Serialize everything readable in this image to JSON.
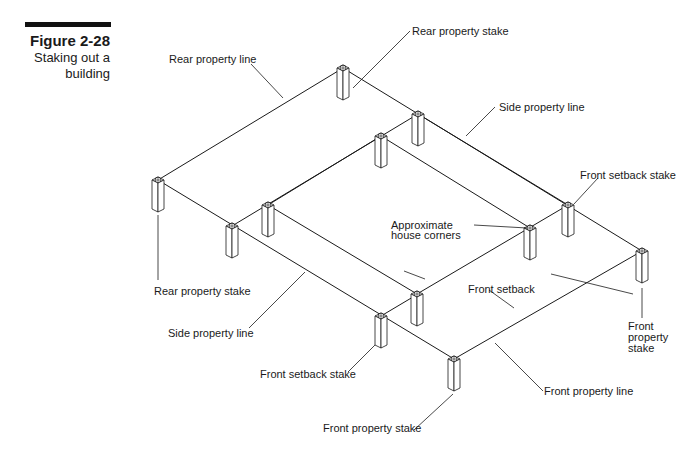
{
  "figure": {
    "number": "Figure 2-28",
    "caption_line1": "Staking out a",
    "caption_line2": "building"
  },
  "labels": {
    "rear_property_line": "Rear property line",
    "rear_property_stake_top": "Rear property stake",
    "side_property_line_top": "Side property line",
    "front_setback_stake_right": "Front setback stake",
    "approximate_house_corners_1": "Approximate",
    "approximate_house_corners_2": "house corners",
    "rear_property_stake_left": "Rear property stake",
    "front_setback": "Front setback",
    "side_property_line_bottom": "Side property line",
    "front_property_stake_right_1": "Front",
    "front_property_stake_right_2": "property",
    "front_property_stake_right_3": "stake",
    "front_setback_stake_bottom": "Front setback stake",
    "front_property_line": "Front property line",
    "front_property_stake_bottom": "Front property stake"
  },
  "colors": {
    "ink": "#1a1a1a",
    "background": "#ffffff"
  }
}
